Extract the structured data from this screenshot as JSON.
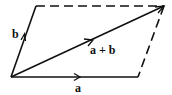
{
  "diagram": {
    "labels": {
      "a": "a",
      "b": "b",
      "sum": "a + b"
    },
    "colors": {
      "line": "#111111",
      "background": "#ffffff"
    }
  }
}
